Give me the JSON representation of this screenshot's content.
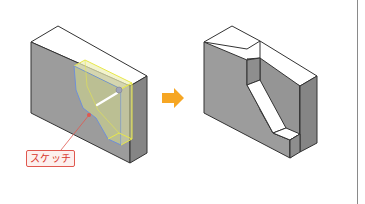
{
  "diagram": {
    "before": {
      "description": "block with sketch profile on front face",
      "callout_label": "スケッチ"
    },
    "arrow": {
      "direction": "right",
      "color": "#f6a623"
    },
    "after": {
      "description": "block with slanted cut-out pocket"
    },
    "colors": {
      "face_front": "#9a9a9a",
      "face_side": "#8a8a8a",
      "face_top": "#ffffff",
      "edge": "#333333",
      "sketch_fill": "#e3e6a0",
      "sketch_outline_yellow": "#e8e84a",
      "sketch_outline_blue": "#6f8fd8",
      "callout_red": "#e0584f"
    }
  }
}
